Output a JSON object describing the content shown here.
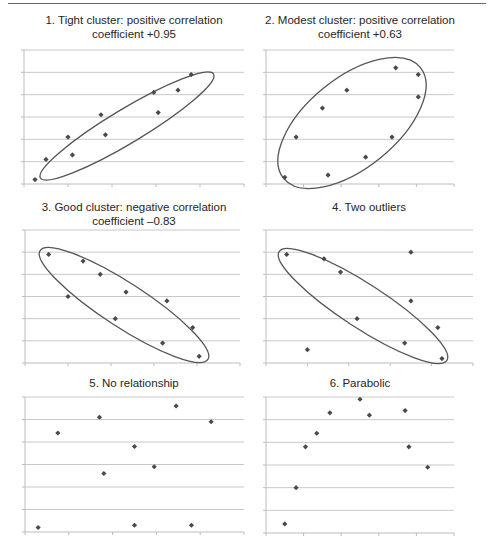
{
  "figure": {
    "caption_visible": "(cropped caption text at bottom edge; illegible)"
  },
  "chart_data": [
    {
      "type": "scatter",
      "title": "1. Tight cluster: positive correlation\ncoefficient +0.95",
      "xlabel": "",
      "ylabel": "",
      "grid": true,
      "legend": null,
      "annotation": "ellipse enclosing points",
      "x": [
        0.5,
        1.0,
        2.0,
        2.2,
        3.5,
        3.7,
        5.9,
        6.1,
        7.0,
        7.6
      ],
      "y": [
        0.2,
        1.1,
        2.1,
        1.3,
        3.1,
        2.2,
        4.1,
        3.2,
        4.2,
        4.9
      ],
      "xlim": [
        0,
        10
      ],
      "ylim": [
        0,
        6
      ]
    },
    {
      "type": "scatter",
      "title": "2. Modest cluster: positive correlation\ncoefficient +0.63",
      "xlabel": "",
      "ylabel": "",
      "grid": true,
      "legend": null,
      "annotation": "ellipse enclosing points",
      "x": [
        1.0,
        1.6,
        3.0,
        3.3,
        4.3,
        5.3,
        6.7,
        6.9,
        8.1,
        8.1
      ],
      "y": [
        0.3,
        2.1,
        3.4,
        0.4,
        4.2,
        1.2,
        2.1,
        5.2,
        4.9,
        3.9
      ],
      "xlim": [
        0,
        10
      ],
      "ylim": [
        0,
        6
      ]
    },
    {
      "type": "scatter",
      "title": "3. Good cluster: negative correlation\ncoefficient –0.83",
      "xlabel": "",
      "ylabel": "",
      "grid": true,
      "legend": null,
      "annotation": "ellipse enclosing points",
      "x": [
        1.1,
        2.0,
        2.7,
        3.5,
        4.2,
        4.7,
        6.4,
        6.6,
        7.8,
        8.1
      ],
      "y": [
        4.9,
        3.0,
        4.6,
        4.0,
        2.0,
        3.2,
        0.9,
        2.8,
        1.6,
        0.3
      ],
      "xlim": [
        0,
        10
      ],
      "ylim": [
        0,
        6
      ]
    },
    {
      "type": "scatter",
      "title": "4. Two outliers",
      "xlabel": "",
      "ylabel": "",
      "grid": true,
      "legend": null,
      "annotation": "ellipse enclosing main cluster; two points outside",
      "x": [
        1.0,
        2.0,
        2.8,
        3.6,
        4.4,
        6.7,
        7.0,
        7.0,
        8.3,
        8.5
      ],
      "y": [
        4.9,
        0.6,
        4.7,
        4.1,
        2.0,
        0.9,
        5.0,
        2.8,
        1.6,
        0.2
      ],
      "outliers": [
        [
          2.0,
          0.6
        ],
        [
          7.0,
          5.0
        ]
      ],
      "xlim": [
        0,
        10
      ],
      "ylim": [
        0,
        6
      ]
    },
    {
      "type": "scatter",
      "title": "5. No relationship",
      "xlabel": "",
      "ylabel": "",
      "grid": true,
      "legend": null,
      "x": [
        0.6,
        1.5,
        3.4,
        3.6,
        5.0,
        5.0,
        5.9,
        6.9,
        7.6,
        8.5
      ],
      "y": [
        0.2,
        4.4,
        5.1,
        2.6,
        3.8,
        0.3,
        2.9,
        5.6,
        0.3,
        4.9
      ],
      "xlim": [
        0,
        10
      ],
      "ylim": [
        0,
        6
      ]
    },
    {
      "type": "scatter",
      "title": "6. Parabolic",
      "xlabel": "",
      "ylabel": "",
      "grid": true,
      "legend": null,
      "x": [
        1.0,
        1.6,
        2.1,
        2.7,
        3.4,
        5.0,
        5.5,
        7.4,
        7.6,
        8.6
      ],
      "y": [
        0.4,
        2.0,
        3.8,
        4.4,
        5.3,
        5.9,
        5.2,
        5.4,
        3.8,
        2.9
      ],
      "xlim": [
        0,
        10
      ],
      "ylim": [
        0,
        6
      ]
    }
  ],
  "style": {
    "marker_color": "#4a4a4a",
    "ellipse_color": "#555555",
    "grid_color": "#c8c8c8",
    "axis_color": "#bdbdbd"
  }
}
